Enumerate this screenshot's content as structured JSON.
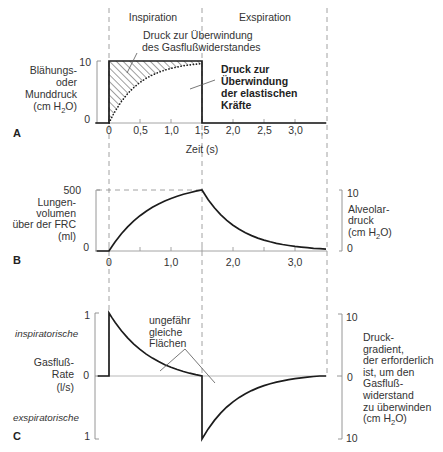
{
  "figure": {
    "phases": {
      "inspiration": "Inspiration",
      "expiration": "Exspiration"
    },
    "unit_cm_h2o": {
      "pre": "(cm H",
      "sub": "2",
      "post": "O)"
    },
    "panel_a": {
      "letter": "A",
      "ylabel_lines": [
        "Blähungs-",
        "oder",
        "Munddruck"
      ],
      "ytick_top": "10",
      "ytick_bottom": "0",
      "xtick_labels": [
        "0",
        "0,5",
        "1,0",
        "1,5",
        "2,0",
        "2,5",
        "3,0"
      ],
      "xlabel": "Zeit (s)",
      "annotation_resistance": [
        "Druck zur Überwindung",
        "des Gasflußwiderstandes"
      ],
      "annotation_elastic": [
        "Druck zur",
        "Überwindung",
        "der elastischen",
        "Kräfte"
      ]
    },
    "panel_b": {
      "letter": "B",
      "ylabel_lines": [
        "Lungen-",
        "volumen",
        "über der FRC",
        "(ml)"
      ],
      "ytick_top": "500",
      "ytick_bottom": "0",
      "xtick_labels": [
        "0",
        "1,0",
        "2,0",
        "3,0"
      ],
      "right_ylabel_lines": [
        "Alveolar-",
        "druck"
      ],
      "right_ytick_top": "10",
      "right_ytick_bottom": "0"
    },
    "panel_c": {
      "letter": "C",
      "region_inspiratory": "inspiratorische",
      "region_expiratory": "exspiratorische",
      "ylabel_lines": [
        "Gasfluß-",
        "Rate",
        "(l/s)"
      ],
      "ytick_top": "1",
      "ytick_zero": "0",
      "ytick_bottom": "1",
      "annotation_areas": [
        "ungefähr",
        "gleiche",
        "Flächen"
      ],
      "right_ytick_top": "10",
      "right_ytick_zero": "0",
      "right_ytick_bottom": "10",
      "right_ylabel_lines": [
        "Druck-",
        "gradient,",
        "der erforderlich",
        "ist, um den",
        "Gasfluß-",
        "widerstand",
        "zu überwinden"
      ]
    }
  },
  "chart_data": {
    "type": "line",
    "xlabel": "Zeit (s)",
    "xlim": [
      -0.2,
      3.5
    ],
    "phases": [
      {
        "label": "Inspiration",
        "from": 0,
        "to": 1.5
      },
      {
        "label": "Exspiration",
        "from": 1.5,
        "to": 3.5
      }
    ],
    "panels": [
      {
        "id": "A",
        "ylabel": "Blähungs- oder Munddruck (cm H2O)",
        "ylim": [
          0,
          10
        ],
        "yticks": [
          0,
          10
        ],
        "xticks": [
          0,
          0.5,
          1.0,
          1.5,
          2.0,
          2.5,
          3.0
        ],
        "series": [
          {
            "name": "Blähungs- oder Munddruck",
            "style": "solid",
            "x": [
              -0.22,
              0,
              0,
              1.5,
              1.5,
              3.5
            ],
            "y": [
              0,
              0,
              10,
              10,
              0,
              0
            ]
          },
          {
            "name": "Alveolardruck",
            "style": "dotted",
            "x": [
              0,
              0.05,
              0.1,
              0.2,
              0.3,
              0.4,
              0.5,
              0.6,
              0.7,
              0.8,
              0.9,
              1.0,
              1.1,
              1.2,
              1.3,
              1.4,
              1.5
            ],
            "y": [
              0,
              1.01,
              1.92,
              3.47,
              4.72,
              5.73,
              6.55,
              7.21,
              7.74,
              8.18,
              8.53,
              8.81,
              9.04,
              9.22,
              9.37,
              9.49,
              9.59
            ]
          }
        ],
        "annotations": [
          "Druck zur Überwindung des Gasflußwiderstandes",
          "Druck zur Überwindung der elastischen Kräfte"
        ]
      },
      {
        "id": "B",
        "ylabel": "Lungenvolumen über der FRC (ml)",
        "ylim": [
          0,
          500
        ],
        "yticks": [
          0,
          500
        ],
        "right_ylabel": "Alveolardruck (cm H2O)",
        "right_ylim": [
          0,
          10
        ],
        "xticks": [
          0,
          0.5,
          1.0,
          1.5,
          2.0,
          2.5,
          3.0
        ],
        "xtick_labels": [
          0,
          1.0,
          2.0,
          3.0
        ],
        "series": [
          {
            "name": "Lungenvolumen",
            "style": "solid",
            "x": [
              -0.2,
              0,
              0.05,
              0.1,
              0.2,
              0.3,
              0.4,
              0.5,
              0.6,
              0.7,
              0.8,
              0.9,
              1.0,
              1.1,
              1.2,
              1.3,
              1.4,
              1.5,
              1.6,
              1.7,
              1.8,
              1.9,
              2.0,
              2.1,
              2.2,
              2.3,
              2.4,
              2.5,
              2.6,
              2.7,
              2.8,
              2.9,
              3.0,
              3.1,
              3.2,
              3.3,
              3.4,
              3.5
            ],
            "y": [
              0,
              0,
              39,
              75.5,
              140.8,
              197.5,
              246.5,
              289,
              326,
              358,
              386,
              410,
              430.5,
              448.5,
              464.5,
              478,
              490,
              500,
              420.8,
              354.2,
              298.1,
              250.9,
              211.1,
              177.7,
              149.6,
              125.9,
              105.9,
              89.2,
              75.0,
              63.2,
              53.2,
              44.7,
              37.7,
              31.7,
              26.7,
              22.4,
              18.9,
              15.9
            ]
          }
        ]
      },
      {
        "id": "C",
        "ylabel": "Gasfluß-Rate (l/s)",
        "ylim": [
          -1,
          1
        ],
        "yticks": [
          -1,
          0,
          1
        ],
        "ytick_labels": [
          "1",
          "0",
          "1"
        ],
        "y_regions": {
          "positive": "inspiratorische",
          "negative": "exspiratorische"
        },
        "right_ylabel": "Druckgradient, der erforderlich ist, um den Gasflußwiderstand zu überwinden (cm H2O)",
        "right_ylim": [
          -10,
          10
        ],
        "right_ytick_labels": [
          "10",
          "0",
          "10"
        ],
        "series": [
          {
            "name": "Gasfluß-Rate",
            "style": "solid",
            "x": [
              -0.18,
              0,
              0,
              0.05,
              0.1,
              0.2,
              0.3,
              0.4,
              0.5,
              0.6,
              0.7,
              0.8,
              0.9,
              1.0,
              1.1,
              1.2,
              1.3,
              1.4,
              1.5,
              1.5,
              1.6,
              1.7,
              1.8,
              1.9,
              2.0,
              2.1,
              2.2,
              2.3,
              2.4,
              2.5,
              2.6,
              2.7,
              2.8,
              2.9,
              3.0,
              3.1,
              3.2,
              3.3,
              3.4,
              3.5
            ],
            "y": [
              0,
              0,
              1,
              0.922,
              0.849,
              0.719,
              0.605,
              0.507,
              0.422,
              0.348,
              0.284,
              0.228,
              0.18,
              0.139,
              0.103,
              0.071,
              0.044,
              0.02,
              0,
              -1,
              -0.84,
              -0.704,
              -0.589,
              -0.492,
              -0.41,
              -0.34,
              -0.281,
              -0.231,
              -0.189,
              -0.153,
              -0.123,
              -0.097,
              -0.076,
              -0.057,
              -0.042,
              -0.029,
              -0.017,
              -0.008,
              0,
              0
            ]
          }
        ],
        "annotations": [
          "ungefähr gleiche Flächen"
        ]
      }
    ]
  }
}
